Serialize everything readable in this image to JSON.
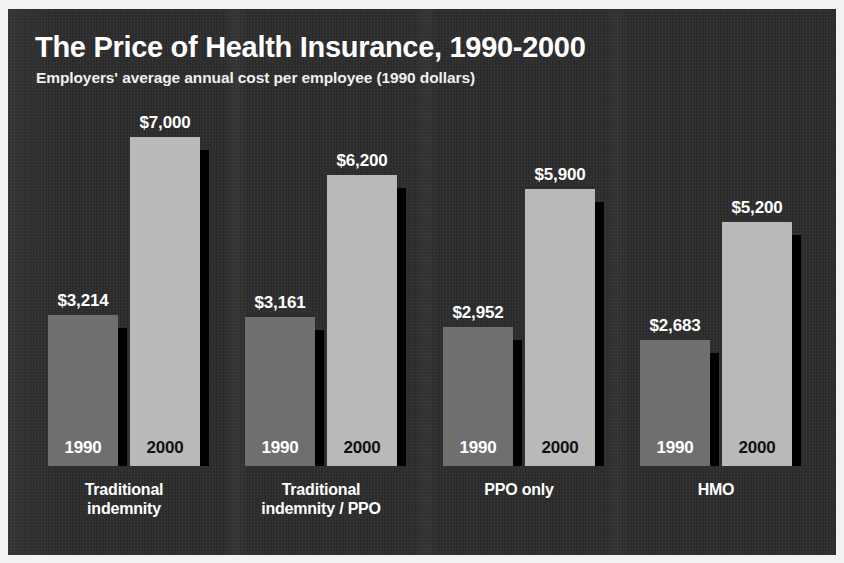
{
  "header": {
    "title": "The Price of Health Insurance, 1990-2000",
    "subtitle": "Employers' average annual cost per employee (1990 dollars)"
  },
  "colors": {
    "panel_background": "#2b2b2b",
    "bar_1990": "#6f6f6f",
    "bar_2000": "#b9b9b9",
    "shadow": "#000000",
    "text_light": "#ffffff",
    "text_dark": "#111111",
    "border": "#f2f2f2"
  },
  "series_labels": {
    "y1990": "1990",
    "y2000": "2000"
  },
  "groups": [
    {
      "label": "Traditional\nindemnity",
      "label_lines": [
        "Traditional",
        "indemnity"
      ],
      "bars": [
        {
          "year": "1990",
          "value": 3214,
          "value_label": "$3,214"
        },
        {
          "year": "2000",
          "value": 7000,
          "value_label": "$7,000"
        }
      ]
    },
    {
      "label": "Traditional\nindemnity / PPO",
      "label_lines": [
        "Traditional",
        "indemnity / PPO"
      ],
      "bars": [
        {
          "year": "1990",
          "value": 3161,
          "value_label": "$3,161"
        },
        {
          "year": "2000",
          "value": 6200,
          "value_label": "$6,200"
        }
      ]
    },
    {
      "label": "PPO only",
      "label_lines": [
        "PPO only"
      ],
      "bars": [
        {
          "year": "1990",
          "value": 2952,
          "value_label": "$2,952"
        },
        {
          "year": "2000",
          "value": 5900,
          "value_label": "$5,900"
        }
      ]
    },
    {
      "label": "HMO",
      "label_lines": [
        "HMO"
      ],
      "bars": [
        {
          "year": "1990",
          "value": 2683,
          "value_label": "$2,683"
        },
        {
          "year": "2000",
          "value": 5200,
          "value_label": "$5,200"
        }
      ]
    }
  ],
  "chart_data": {
    "type": "bar",
    "title": "The Price of Health Insurance, 1990-2000",
    "subtitle": "Employers' average annual cost per employee (1990 dollars)",
    "xlabel": "",
    "ylabel": "",
    "ylim": [
      0,
      7000
    ],
    "grid": false,
    "legend": "in-bar year labels",
    "categories": [
      "Traditional indemnity",
      "Traditional indemnity / PPO",
      "PPO only",
      "HMO"
    ],
    "series": [
      {
        "name": "1990",
        "values": [
          3214,
          3161,
          2952,
          2683
        ],
        "color": "#6f6f6f"
      },
      {
        "name": "2000",
        "values": [
          7000,
          6200,
          5900,
          5200
        ],
        "color": "#b9b9b9"
      }
    ],
    "data_labels": [
      [
        "$3,214",
        "$7,000"
      ],
      [
        "$3,161",
        "$6,200"
      ],
      [
        "$2,952",
        "$5,900"
      ],
      [
        "$2,683",
        "$5,200"
      ]
    ]
  },
  "layout": {
    "baseline_y": 457,
    "bar_width": 70,
    "shadow_width": 9,
    "group_x": [
      40,
      237,
      435,
      632
    ],
    "bar_gap": 82
  }
}
